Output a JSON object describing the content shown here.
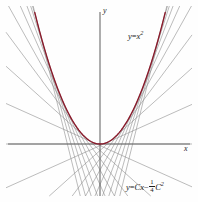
{
  "figure": {
    "background_color": "#fefefe"
  },
  "axes": {
    "x_label": "x",
    "y_label": "y",
    "axis_color": "#6a6a6a",
    "origin_px": [
      100,
      144
    ]
  },
  "curve": {
    "label_y": "y",
    "label_eq": "=",
    "label_x": "x",
    "label_exp": "2",
    "color": "#8b1a2b"
  },
  "family": {
    "label_y": "y",
    "label_eq": "=",
    "label_C": "C",
    "label_x": "x",
    "label_minus": "−",
    "frac_num": "1",
    "frac_den": "4",
    "label_C2": "C",
    "label_C2_exp": "2",
    "color": "#8e8e8e"
  },
  "chart_data": {
    "type": "line",
    "title": "",
    "xlabel": "x",
    "ylabel": "y",
    "grid": false,
    "legend_position": "none",
    "xlim": [
      -3.1,
      3.1
    ],
    "ylim": [
      -2.4,
      5.2
    ],
    "series": [
      {
        "name": "y = x^2",
        "type": "parabola",
        "color": "#8b1a2b",
        "equation": "y = x^2",
        "x": [
          -2.25,
          -2.0,
          -1.75,
          -1.5,
          -1.25,
          -1.0,
          -0.75,
          -0.5,
          -0.25,
          0,
          0.25,
          0.5,
          0.75,
          1.0,
          1.25,
          1.5,
          1.75,
          2.0,
          2.25
        ],
        "y": [
          5.0625,
          4.0,
          3.0625,
          2.25,
          1.5625,
          1.0,
          0.5625,
          0.25,
          0.0625,
          0,
          0.0625,
          0.25,
          0.5625,
          1.0,
          1.5625,
          2.25,
          3.0625,
          4.0,
          5.0625
        ]
      },
      {
        "name": "y = Cx - (1/4)C^2",
        "type": "tangent-family",
        "color": "#8e8e8e",
        "equation": "y = Cx - 1/4 C^2",
        "C_values": [
          -4.5,
          -4.0,
          -3.5,
          -3.0,
          -2.5,
          -2.0,
          -1.5,
          -1.0,
          -0.5,
          0,
          0.5,
          1.0,
          1.5,
          2.0,
          2.5,
          3.0,
          3.5,
          4.0,
          4.5
        ],
        "tangent_points_x": [
          -2.25,
          -2.0,
          -1.75,
          -1.5,
          -1.25,
          -1.0,
          -0.75,
          -0.5,
          -0.25,
          0,
          0.25,
          0.5,
          0.75,
          1.0,
          1.25,
          1.5,
          1.75,
          2.0,
          2.25
        ]
      }
    ],
    "annotations": [
      {
        "text": "y = x^2",
        "x": 1.6,
        "y": 3.85
      },
      {
        "text": "y = Cx - 1/4 C^2",
        "x": 1.0,
        "y": -1.85
      }
    ]
  }
}
